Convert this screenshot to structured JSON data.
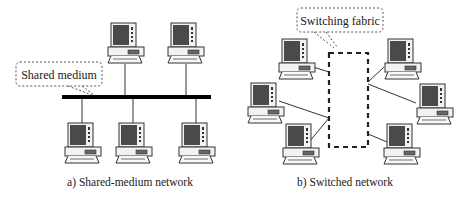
{
  "diagram": {
    "left": {
      "caption": "a) Shared-medium network",
      "callout": "Shared medium",
      "bus": {
        "x1": 62,
        "x2": 211,
        "y": 97
      },
      "computers": [
        {
          "id": "top-1",
          "x": 108,
          "y": 23,
          "link_y1": 65,
          "link_y2": 95
        },
        {
          "id": "top-2",
          "x": 168,
          "y": 23,
          "link_y1": 65,
          "link_y2": 95
        },
        {
          "id": "bottom-1",
          "x": 65,
          "y": 123,
          "link_y1": 99,
          "link_y2": 123
        },
        {
          "id": "bottom-2",
          "x": 116,
          "y": 123,
          "link_y1": 99,
          "link_y2": 123
        },
        {
          "id": "bottom-3",
          "x": 179,
          "y": 123,
          "link_y1": 99,
          "link_y2": 123
        }
      ]
    },
    "right": {
      "caption": "b) Switched network",
      "callout": "Switching fabric",
      "fabric": {
        "x": 329,
        "y": 53,
        "width": 39,
        "height": 94
      },
      "computers": [
        {
          "id": "top-left",
          "x": 279,
          "y": 39
        },
        {
          "id": "left",
          "x": 248,
          "y": 83
        },
        {
          "id": "bottom-left",
          "x": 283,
          "y": 124
        },
        {
          "id": "top-right",
          "x": 385,
          "y": 39
        },
        {
          "id": "right",
          "x": 417,
          "y": 84
        },
        {
          "id": "bottom-right",
          "x": 384,
          "y": 124
        }
      ]
    },
    "colors": {
      "screen": "#4a4a4a",
      "outline": "#333333",
      "bus": "#000000",
      "dash": "#222222",
      "link": "#333333"
    }
  }
}
